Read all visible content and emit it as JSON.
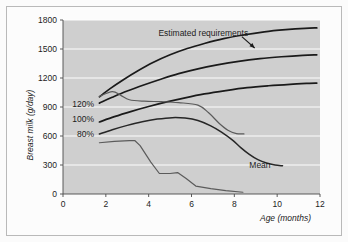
{
  "figure": {
    "background": "#fbfbfb",
    "plot_background": "#cfcfcf",
    "frame_color": "#b9b9b9"
  },
  "chart_data": {
    "type": "line",
    "title": "",
    "xlabel": "Age (months)",
    "ylabel": "Breast milk (g/day)",
    "xlim": [
      0,
      12
    ],
    "ylim": [
      0,
      1800
    ],
    "xticks": [
      0,
      2,
      4,
      6,
      8,
      10,
      12
    ],
    "yticks": [
      0,
      300,
      600,
      900,
      1200,
      1500,
      1800
    ],
    "xtick_labels": [
      "0",
      "2",
      "4",
      "6",
      "8",
      "10",
      "12"
    ],
    "ytick_labels": [
      "0",
      "300",
      "600",
      "900",
      "1200",
      "1500",
      "1800"
    ],
    "grid": true,
    "grid_color": "#fdfdfd",
    "legend": "inline-labels",
    "annotations": [
      {
        "name": "estimated-requirements",
        "text": "Estimated requirements",
        "x": 6.55,
        "y": 1662,
        "anchor": "middle",
        "leader": {
          "x1": 8.35,
          "y1": 1628,
          "x2": 8.95,
          "y2": 1510
        }
      },
      {
        "name": "mean",
        "text": "Mean",
        "x": 8.7,
        "y": 300,
        "anchor": "start"
      }
    ],
    "series": [
      {
        "name": "Estimated requirements 120%",
        "label": "120%",
        "label_x": 1.45,
        "label_y": 930,
        "color": "#1a1a1a",
        "style": "requirement",
        "points": [
          [
            1.7,
            1005
          ],
          [
            2.2,
            1090
          ],
          [
            2.8,
            1180
          ],
          [
            3.5,
            1275
          ],
          [
            4.2,
            1360
          ],
          [
            5.0,
            1440
          ],
          [
            5.8,
            1505
          ],
          [
            6.6,
            1557
          ],
          [
            7.5,
            1607
          ],
          [
            8.4,
            1645
          ],
          [
            9.4,
            1678
          ],
          [
            10.4,
            1700
          ],
          [
            11.3,
            1714
          ],
          [
            11.85,
            1718
          ]
        ]
      },
      {
        "name": "Estimated requirements 100%",
        "label": "100%",
        "label_x": 1.45,
        "label_y": 775,
        "color": "#1a1a1a",
        "style": "requirement",
        "points": [
          [
            1.7,
            940
          ],
          [
            2.3,
            1000
          ],
          [
            3.0,
            1065
          ],
          [
            3.8,
            1130
          ],
          [
            4.6,
            1190
          ],
          [
            5.4,
            1245
          ],
          [
            6.3,
            1295
          ],
          [
            7.2,
            1335
          ],
          [
            8.2,
            1372
          ],
          [
            9.2,
            1400
          ],
          [
            10.2,
            1420
          ],
          [
            11.2,
            1435
          ],
          [
            11.85,
            1440
          ]
        ]
      },
      {
        "name": "Estimated requirements 80%",
        "label": "80%",
        "label_x": 1.45,
        "label_y": 620,
        "color": "#1a1a1a",
        "style": "requirement",
        "points": [
          [
            1.7,
            745
          ],
          [
            2.4,
            800
          ],
          [
            3.2,
            855
          ],
          [
            4.0,
            905
          ],
          [
            4.8,
            950
          ],
          [
            5.7,
            995
          ],
          [
            6.6,
            1035
          ],
          [
            7.6,
            1070
          ],
          [
            8.6,
            1100
          ],
          [
            9.6,
            1120
          ],
          [
            10.6,
            1135
          ],
          [
            11.5,
            1145
          ],
          [
            11.85,
            1148
          ]
        ]
      },
      {
        "name": "Mean breast milk intake",
        "label": "Mean",
        "color": "#262626",
        "style": "mean",
        "points": [
          [
            1.7,
            620
          ],
          [
            2.3,
            665
          ],
          [
            3.0,
            710
          ],
          [
            3.7,
            748
          ],
          [
            4.4,
            775
          ],
          [
            5.1,
            790
          ],
          [
            5.7,
            785
          ],
          [
            6.3,
            760
          ],
          [
            6.9,
            705
          ],
          [
            7.4,
            640
          ],
          [
            7.9,
            560
          ],
          [
            8.3,
            480
          ],
          [
            8.7,
            410
          ],
          [
            9.1,
            355
          ],
          [
            9.5,
            320
          ],
          [
            9.9,
            300
          ],
          [
            10.25,
            292
          ]
        ]
      },
      {
        "name": "Observed intake upper",
        "label": "",
        "color": "#5b5b5b",
        "style": "observed",
        "points": [
          [
            1.7,
            1010
          ],
          [
            2.3,
            1060
          ],
          [
            2.7,
            1020
          ],
          [
            3.1,
            975
          ],
          [
            3.8,
            960
          ],
          [
            4.6,
            955
          ],
          [
            5.4,
            945
          ],
          [
            6.3,
            920
          ],
          [
            6.8,
            840
          ],
          [
            7.3,
            730
          ],
          [
            7.7,
            660
          ],
          [
            8.1,
            625
          ],
          [
            8.45,
            622
          ]
        ]
      },
      {
        "name": "Observed intake lower",
        "label": "",
        "color": "#5b5b5b",
        "style": "observed",
        "points": [
          [
            1.7,
            530
          ],
          [
            2.4,
            545
          ],
          [
            3.1,
            552
          ],
          [
            3.35,
            553
          ],
          [
            3.6,
            500
          ],
          [
            4.1,
            330
          ],
          [
            4.5,
            212
          ],
          [
            5.0,
            212
          ],
          [
            5.35,
            222
          ],
          [
            5.75,
            160
          ],
          [
            6.2,
            82
          ],
          [
            6.9,
            55
          ],
          [
            7.6,
            35
          ],
          [
            8.4,
            18
          ]
        ]
      }
    ]
  }
}
